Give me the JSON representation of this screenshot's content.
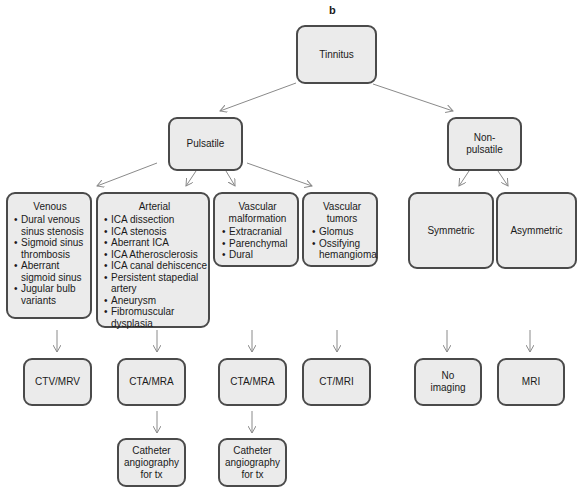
{
  "panel_label": "b",
  "root": {
    "label": "Tinnitus"
  },
  "level1": {
    "pulsatile": {
      "label": "Pulsatile"
    },
    "non_pulsatile": {
      "label": "Non-pulsatile",
      "line1": "Non-",
      "line2": "pulsatile"
    }
  },
  "level2": {
    "venous": {
      "title": "Venous",
      "items": [
        "Dural venous sinus stenosis",
        "Sigmoid sinus thrombosis",
        "Aberrant sigmoid sinus",
        "Jugular bulb variants"
      ]
    },
    "arterial": {
      "title": "Arterial",
      "items": [
        "ICA dissection",
        "ICA stenosis",
        "Aberrant ICA",
        "ICA Atherosclerosis",
        "ICA canal dehiscence",
        "Persistent stapedial artery",
        "Aneurysm",
        "Fibromuscular dysplasia"
      ]
    },
    "vascular_malformation": {
      "title": "Vascular malformation",
      "items": [
        "Extracranial",
        "Parenchymal",
        "Dural"
      ]
    },
    "vascular_tumors": {
      "title": "Vascular tumors",
      "items": [
        "Glomus",
        "Ossifying hemangioma"
      ]
    },
    "symmetric": {
      "label": "Symmetric"
    },
    "asymmetric": {
      "label": "Asymmetric"
    }
  },
  "level3": {
    "venous_imaging": {
      "label": "CTV/MRV"
    },
    "arterial_imaging": {
      "label": "CTA/MRA"
    },
    "malformation_imaging": {
      "label": "CTA/MRA"
    },
    "tumor_imaging": {
      "label": "CT/MRI"
    },
    "symmetric_imaging": {
      "label": "No imaging",
      "line1": "No",
      "line2": "imaging"
    },
    "asymmetric_imaging": {
      "label": "MRI"
    }
  },
  "level4": {
    "arterial_treatment": {
      "label": "Catheter angiography for tx",
      "line1": "Catheter",
      "line2": "angiography",
      "line3": "for tx"
    },
    "malformation_treatment": {
      "label": "Catheter angiography for tx",
      "line1": "Catheter",
      "line2": "angiography",
      "line3": "for tx"
    }
  },
  "colors": {
    "node_fill": "#ebebeb",
    "node_border": "#4a4a4a",
    "arrow": "#8a8a8a"
  }
}
